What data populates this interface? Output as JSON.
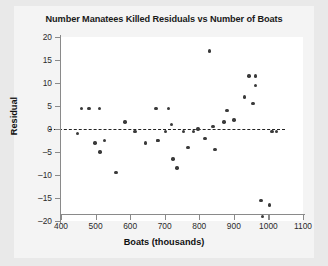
{
  "chart_data": {
    "type": "scatter",
    "title": "Number Manatees Killed Residuals vs Number of Boats",
    "xlabel": "Boats (thousands)",
    "ylabel": "Residual",
    "xlim": [
      400,
      1100
    ],
    "ylim": [
      -20,
      20
    ],
    "xticks": [
      400,
      500,
      600,
      700,
      800,
      900,
      1000,
      1100
    ],
    "yticks": [
      20,
      15,
      10,
      5,
      0,
      -5,
      -10,
      -15,
      -20
    ],
    "grid": false,
    "legend": null,
    "reference_line": {
      "type": "horizontal-dashed",
      "y": 0
    },
    "x": [
      447,
      460,
      481,
      498,
      513,
      512,
      526,
      559,
      585,
      614,
      645,
      675,
      711,
      719,
      681,
      679,
      703,
      724,
      735,
      754,
      767,
      783,
      796,
      817,
      830,
      880,
      944,
      962,
      978,
      983,
      1010,
      1024,
      1003,
      963,
      930,
      900,
      872,
      845,
      840,
      955
    ],
    "y": [
      -1.0,
      4.5,
      4.5,
      -3.0,
      -5.0,
      4.5,
      -2.5,
      -9.5,
      1.5,
      -0.5,
      -3.0,
      4.5,
      4.5,
      1.0,
      -2.5,
      -2.5,
      -0.5,
      -6.5,
      -8.5,
      -0.5,
      -4.0,
      -0.5,
      0.0,
      -2.0,
      17.0,
      4.0,
      11.5,
      11.5,
      -15.5,
      -19.0,
      -0.5,
      -0.5,
      -16.5,
      9.5,
      7.0,
      2.0,
      1.5,
      -4.5,
      0.5,
      5.5
    ]
  }
}
